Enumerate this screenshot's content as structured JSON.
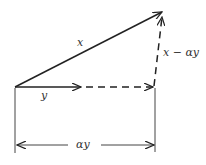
{
  "diagram": {
    "type": "vector-projection",
    "labels": {
      "x": "x",
      "y": "y",
      "difference": "x − αy",
      "dimension": "αy"
    },
    "colors": {
      "stroke": "#222222",
      "text": "#333333",
      "background": "#ffffff"
    }
  }
}
